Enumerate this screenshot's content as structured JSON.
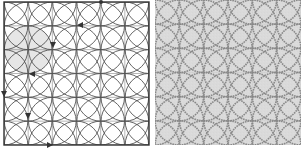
{
  "figure": {
    "left": {
      "kind": "line-diagram",
      "pattern": "orange-peel overlapping circles",
      "frame": {
        "x": 4,
        "y": 2,
        "width": 145,
        "height": 143
      },
      "grid": {
        "cols": 6,
        "rows": 6,
        "cell": 24.2
      },
      "circle_radius_cells": 1,
      "highlighted_circle": {
        "col": 1,
        "row": 2,
        "fill": "#e6e6e6"
      },
      "markers": [
        {
          "type": "dot",
          "x": 101,
          "y": 2
        },
        {
          "type": "arrow",
          "x": 80,
          "y": 25,
          "direction": "left"
        },
        {
          "type": "arrow",
          "x": 53,
          "y": 45,
          "direction": "down"
        },
        {
          "type": "arrow",
          "x": 32,
          "y": 74,
          "direction": "left"
        },
        {
          "type": "arrow",
          "x": 4,
          "y": 94,
          "direction": "down"
        },
        {
          "type": "arrow",
          "x": 28,
          "y": 116,
          "direction": "down"
        },
        {
          "type": "arrow",
          "x": 50,
          "y": 145,
          "direction": "right"
        }
      ],
      "colors": {
        "line": "#555555",
        "frame": "#333333",
        "grid": "#888888",
        "background": "#ffffff"
      }
    },
    "right": {
      "kind": "photo",
      "subject": "quilted fabric with stitched orange-peel circle pattern",
      "frame": {
        "x": 155,
        "y": 0,
        "width": 146,
        "height": 145
      },
      "grid": {
        "cols": 6,
        "rows": 6,
        "cell": 24.3
      },
      "colors": {
        "fabric": "#dadada",
        "stitch": "#5f5f5f",
        "grid": "#c4c4c4"
      }
    }
  }
}
